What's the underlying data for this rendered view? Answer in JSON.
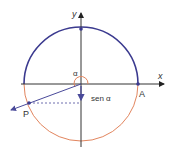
{
  "diagram": {
    "type": "unit-circle-sine",
    "labels": {
      "y_axis": "y",
      "x_axis": "x",
      "angle": "α",
      "point_a": "A",
      "point_p": "P",
      "sine": "sen α"
    },
    "colors": {
      "upper_arc": "#3b3a8f",
      "lower_arc": "#e2855e",
      "axes": "#333333",
      "vector": "#4a4a9a",
      "points": "#3b3a8f",
      "dashed": "#4a4a9a",
      "angle_arc": "#e2855e"
    }
  }
}
